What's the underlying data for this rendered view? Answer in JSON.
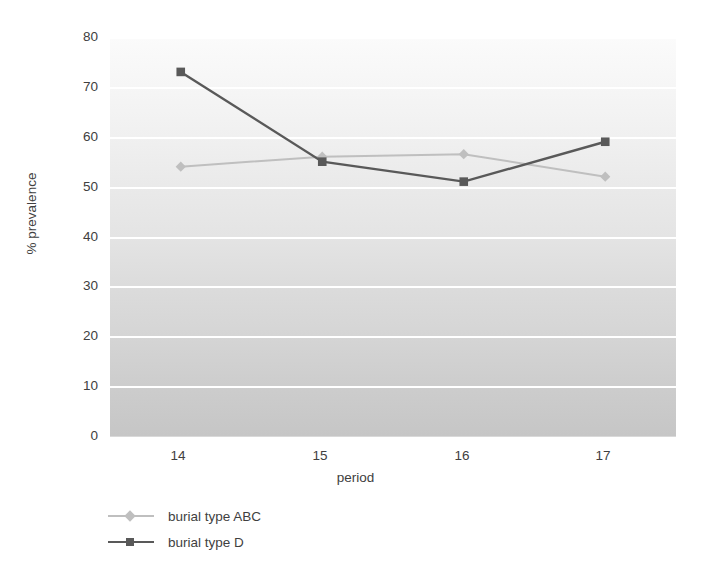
{
  "chart_data": {
    "type": "line",
    "title": "",
    "xlabel": "period",
    "ylabel": "% prevalence",
    "categories": [
      "14",
      "15",
      "16",
      "17"
    ],
    "x": [
      14,
      15,
      16,
      17
    ],
    "xlim": [
      13.5,
      17.5
    ],
    "ylim": [
      0,
      80
    ],
    "ytick_labels": [
      "0",
      "10",
      "20",
      "30",
      "40",
      "50",
      "60",
      "70",
      "80"
    ],
    "yticks": [
      0,
      10,
      20,
      30,
      40,
      50,
      60,
      70,
      80
    ],
    "grid": "horizontal-white",
    "legend_position": "bottom-left",
    "series": [
      {
        "name": "burial type ABC",
        "color": "#bfbfbf",
        "marker": "diamond",
        "values": [
          54,
          56,
          56.5,
          52
        ]
      },
      {
        "name": "burial type D",
        "color": "#595959",
        "marker": "square",
        "values": [
          73,
          55,
          51,
          59
        ]
      }
    ]
  },
  "axes": {
    "x_title": "period",
    "y_title": "% prevalence",
    "x_ticks": [
      "14",
      "15",
      "16",
      "17"
    ],
    "y_ticks": [
      "80",
      "70",
      "60",
      "50",
      "40",
      "30",
      "20",
      "10",
      "0"
    ]
  },
  "legend": {
    "items": [
      {
        "label": "burial type ABC",
        "color": "#bfbfbf",
        "marker": "diamond"
      },
      {
        "label": "burial type D",
        "color": "#595959",
        "marker": "square"
      }
    ]
  },
  "colors": {
    "series_abc": "#bfbfbf",
    "series_d": "#595959",
    "gridline": "#ffffff",
    "text": "#404040",
    "plot_bg_top": "#fbfbfb",
    "plot_bg_bottom": "#c6c6c6"
  }
}
